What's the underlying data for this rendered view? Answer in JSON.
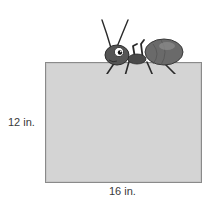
{
  "diagram": {
    "shape": "rectangle",
    "fill_color": "#d4d4d4",
    "border_color": "#8a8a8a",
    "dimensions": {
      "height_label": "12 in.",
      "width_label": "16 in."
    },
    "decoration": {
      "icon": "ant-icon",
      "position": "sitting on top edge of rectangle"
    }
  }
}
